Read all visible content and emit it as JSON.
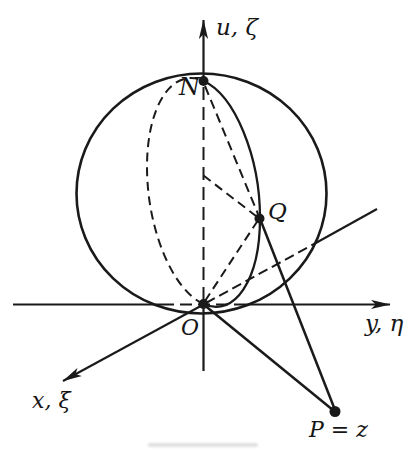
{
  "figure": {
    "background": "#ffffff",
    "ink_color": "#1a1a1a",
    "labels": {
      "vertical_axis": "u, ζ",
      "north_pole": "N",
      "sphere_point": "Q",
      "origin": "O",
      "horizontal_axis": "y, η",
      "depth_axis": "x, ξ",
      "plane_point": "P = z"
    }
  }
}
